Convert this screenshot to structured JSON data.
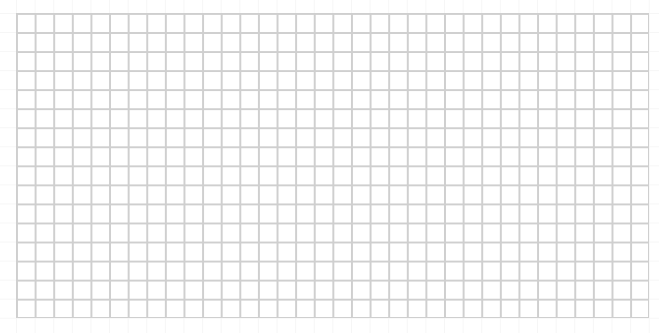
{
  "grid": {
    "columns": 34,
    "rows": 16,
    "line_color": "#cfcfcf",
    "background_color": "#ffffff"
  }
}
